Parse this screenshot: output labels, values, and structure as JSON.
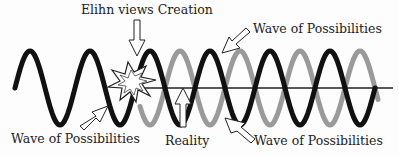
{
  "diagram": {
    "title": "Elihn views Creation",
    "labels": {
      "top_center": "Elihn views Creation",
      "top_right": "Wave of Possibilities",
      "bottom_left": "Wave of Possibilities",
      "bottom_center": "Reality",
      "bottom_right": "Wave of Possibilities"
    },
    "waves": [
      {
        "name": "black-wave",
        "color": "#111111",
        "role": "Wave of Possibilities (observed)"
      },
      {
        "name": "gray-wave",
        "color": "#9a9a9a",
        "role": "Wave of Possibilities (alternate)"
      }
    ],
    "reality_line_color": "#222222",
    "burst_color": "#ffffff"
  }
}
